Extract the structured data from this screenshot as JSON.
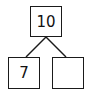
{
  "diagram": {
    "type": "number-bond",
    "whole": {
      "value": "10"
    },
    "parts": [
      {
        "value": "7"
      },
      {
        "value": ""
      }
    ],
    "colors": {
      "stroke": "#1a1a1a",
      "text": "#111111",
      "background": "#ffffff"
    }
  }
}
